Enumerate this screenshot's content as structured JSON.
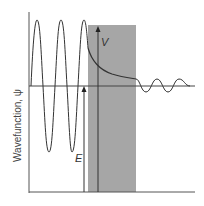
{
  "diagram": {
    "ylabel": "Wavefunction, ψ",
    "labels": {
      "potential": "V",
      "energy": "E"
    },
    "colors": {
      "barrier": "#a6a6a6",
      "line": "#333333"
    }
  }
}
